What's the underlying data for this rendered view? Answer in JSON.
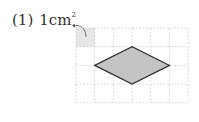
{
  "problem": {
    "number": "(1)",
    "unit_value": "1",
    "unit": "cm",
    "unit_exponent": "2"
  },
  "grid": {
    "origin_x": 76,
    "origin_y": 28,
    "cell_size": 18.7,
    "columns": 6,
    "rows": 4,
    "line_color": "#c8c8c8",
    "unit_cell_fill": "#e6e6e6"
  },
  "shape": {
    "type": "rhombus",
    "fill": "#c4c4c4",
    "stroke": "#333333",
    "vertices_grid": [
      [
        1,
        2
      ],
      [
        3,
        1
      ],
      [
        5,
        2
      ],
      [
        3,
        3
      ]
    ]
  }
}
